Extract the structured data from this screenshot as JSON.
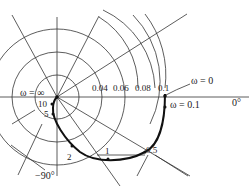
{
  "diagram": {
    "type": "polar-frequency-response-plot",
    "origin_label": "ω = ∞",
    "start_label": "ω = 0",
    "point_label_01": "ω = 0.1",
    "axis_labels": {
      "zero_deg": "0°",
      "minus90_deg": "−90°"
    },
    "circle_labels": [
      "0.04",
      "0.06",
      "0.08",
      "0.1"
    ],
    "frequency_point_labels": [
      "10",
      "5",
      "2",
      "1",
      "0.5"
    ],
    "colors": {
      "line": "#333333",
      "curve": "#111111",
      "background": "#ffffff"
    }
  }
}
